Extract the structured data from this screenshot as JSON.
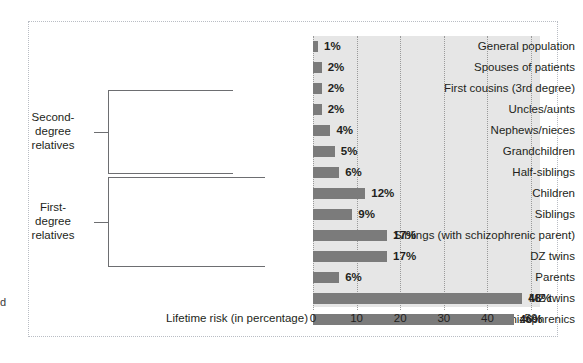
{
  "figure": {
    "edge_artifact": "d"
  },
  "chart_data": {
    "type": "bar",
    "orientation": "horizontal",
    "title": "",
    "xlabel": "Lifetime risk (in percentage)",
    "ylabel": "",
    "xlim": [
      0,
      53
    ],
    "xticks": [
      0,
      10,
      20,
      30,
      40,
      50
    ],
    "xtick_labels": [
      "0",
      "10",
      "20",
      "30",
      "40",
      "50"
    ],
    "grid": "vertical-dotted",
    "legend": "none",
    "bar_color": "#7b7b7b",
    "plot_background": "#e6e6e6",
    "categories": [
      "General population",
      "Spouses of patients",
      "First cousins (3rd degree)",
      "Uncles/aunts",
      "Nephews/nieces",
      "Grandchildren",
      "Half-siblings",
      "Children",
      "Siblings",
      "Siblings (with schizophrenic parent)",
      "DZ twins",
      "Parents",
      "MZ twins",
      "Offspring of two schizophrenics"
    ],
    "values": [
      1,
      2,
      2,
      2,
      4,
      5,
      6,
      12,
      9,
      17,
      17,
      6,
      48,
      46
    ],
    "data_labels": [
      "1%",
      "2%",
      "2%",
      "2%",
      "4%",
      "5%",
      "6%",
      "12%",
      "9%",
      "17%",
      "17%",
      "6%",
      "48%",
      "46%"
    ],
    "annotations": [
      {
        "label": "Second-degree relatives",
        "label_lines": [
          "Second-",
          "degree",
          "relatives"
        ],
        "covers": [
          "Uncles/aunts",
          "Nephews/nieces",
          "Grandchildren",
          "Half-siblings"
        ]
      },
      {
        "label": "First-degree relatives",
        "label_lines": [
          "First-",
          "degree",
          "relatives"
        ],
        "covers": [
          "Children",
          "Siblings",
          "Siblings (with schizophrenic parent)",
          "DZ twins",
          "Parents"
        ]
      }
    ]
  }
}
